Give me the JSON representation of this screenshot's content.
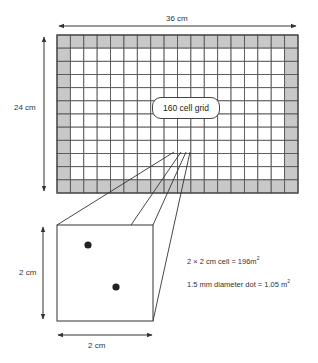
{
  "dimensions": {
    "grid_width_label": "36 cm",
    "grid_height_label": "24 cm",
    "cell_height_label": "2 cm",
    "cell_width_label": "2 cm"
  },
  "grid": {
    "label": "160 cell grid",
    "columns": 18,
    "rows": 12,
    "interior_columns": 16,
    "interior_rows": 10,
    "border_fill": "#c8c8c8",
    "line_color": "#555555"
  },
  "cell_detail": {
    "dots": 2
  },
  "notes": {
    "cell_area_text": "2 × 2 cm cell = 196m",
    "cell_area_sup": "2",
    "dot_area_text": "1.5 mm diameter dot = 1.05 m",
    "dot_area_sup": "2"
  }
}
